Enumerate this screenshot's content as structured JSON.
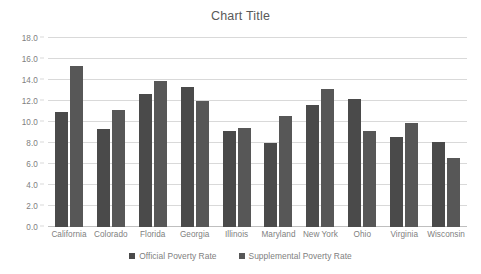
{
  "chart_data": {
    "type": "bar",
    "title": "Chart Title",
    "xlabel": "",
    "ylabel": "",
    "ylim": [
      0.0,
      18.0
    ],
    "ytick_step": 2.0,
    "ytick_labels": [
      "0.0",
      "2.0",
      "4.0",
      "6.0",
      "8.0",
      "10.0",
      "12.0",
      "14.0",
      "16.0",
      "18.0"
    ],
    "ytick_values": [
      0.0,
      2.0,
      4.0,
      6.0,
      8.0,
      10.0,
      12.0,
      14.0,
      16.0,
      18.0
    ],
    "grid": true,
    "legend_position": "bottom",
    "categories": [
      "California",
      "Colorado",
      "Florida",
      "Georgia",
      "Illinois",
      "Maryland",
      "New York",
      "Ohio",
      "Virginia",
      "Wisconsin"
    ],
    "series": [
      {
        "name": "Official Poverty Rate",
        "color": "#4a4a4a",
        "values": [
          11.0,
          9.3,
          12.7,
          13.3,
          9.1,
          8.0,
          11.6,
          12.2,
          8.6,
          8.1
        ]
      },
      {
        "name": "Supplemental Poverty Rate",
        "color": "#575757",
        "values": [
          15.3,
          11.1,
          13.9,
          12.0,
          9.4,
          10.6,
          13.1,
          9.1,
          9.9,
          6.6
        ]
      }
    ]
  }
}
